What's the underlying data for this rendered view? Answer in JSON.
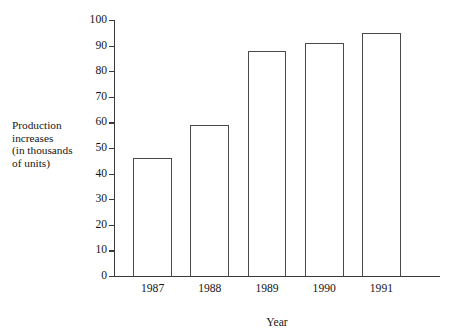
{
  "chart_data": {
    "type": "bar",
    "title": "",
    "subtitle": "",
    "categories": [
      "1987",
      "1988",
      "1989",
      "1990",
      "1991"
    ],
    "values": [
      46,
      59,
      88,
      91,
      95
    ],
    "series": [
      {
        "name": "Production increases",
        "values": [
          46,
          59,
          88,
          91,
          95
        ]
      }
    ],
    "xlabel": "Year",
    "ylabel": "Production increases (in thousands of units)",
    "ylabel_lines": [
      "Production",
      "increases",
      "(in thousands",
      "of units)"
    ],
    "ylim": [
      0,
      100
    ],
    "xlim_categories": 5,
    "y_ticks": [
      0,
      10,
      20,
      30,
      40,
      50,
      60,
      70,
      80,
      90,
      100
    ],
    "y_tick_labels": [
      "0",
      "10",
      "20",
      "30",
      "40",
      "50",
      "60",
      "70",
      "80",
      "90",
      "100"
    ],
    "x_tick_labels": [
      "1987",
      "1988",
      "1989",
      "1990",
      "1991"
    ],
    "grid": false,
    "legend": false,
    "legend_position": "none",
    "bar_fill_color": "#ffffff",
    "bar_edge_color": "#4a4a4a",
    "axis_color": "#3a3a3a",
    "text_color": "#161616",
    "background_color": "#ffffff"
  }
}
